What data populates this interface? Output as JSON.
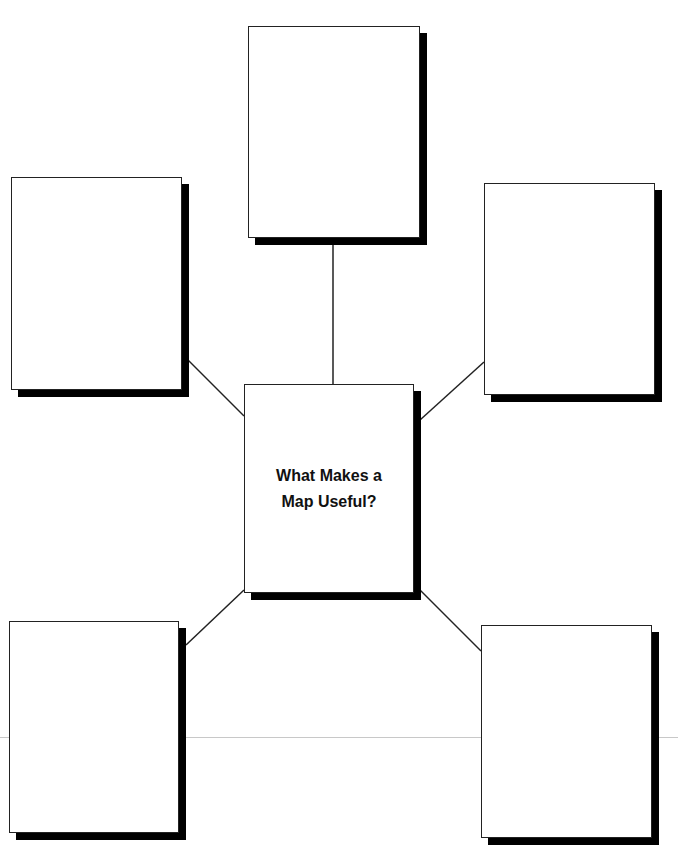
{
  "diagram": {
    "type": "web-graphic-organizer",
    "center": {
      "title_line1": "What Makes a",
      "title_line2": "Map Useful?"
    },
    "outer_boxes": [
      {
        "position": "top",
        "content": ""
      },
      {
        "position": "top-left",
        "content": ""
      },
      {
        "position": "top-right",
        "content": ""
      },
      {
        "position": "bottom-left",
        "content": ""
      },
      {
        "position": "bottom-right",
        "content": ""
      }
    ],
    "colors": {
      "border": "#222222",
      "shadow": "#000000",
      "background": "#ffffff",
      "guide_line": "#c8c8c8"
    }
  }
}
